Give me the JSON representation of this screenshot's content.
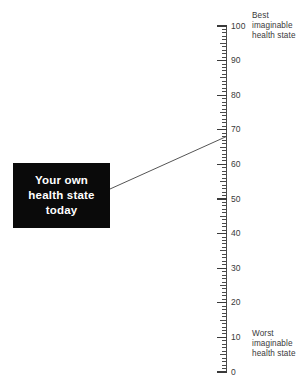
{
  "figure": {
    "name": "eq5d-visual-analogue-scale",
    "background_color": "#ffffff",
    "line_color": "#4a4a4a"
  },
  "callout": {
    "name": "your-own-health-state-today",
    "background_color": "#0a0a0a",
    "text_color": "#ffffff",
    "line1": "Your own",
    "line2": "health state",
    "line3": "today",
    "pointer_value": 68
  },
  "anchors": {
    "best": {
      "line1": "Best",
      "line2": "imaginable",
      "line3": "health state",
      "value": 100
    },
    "worst": {
      "line1": "Worst",
      "line2": "imaginable",
      "line3": "health state",
      "value": 0
    }
  },
  "chart_data": {
    "type": "scatter",
    "title": "",
    "xlabel": "",
    "ylabel": "",
    "ylim": [
      0,
      100
    ],
    "orientation": "vertical",
    "grid": false,
    "legend": "none",
    "tick_major_step": 10,
    "tick_minor_step": 1,
    "tick_mid_step": 5,
    "tick_labels": [
      "100",
      "90",
      "80",
      "70",
      "60",
      "50",
      "40",
      "30",
      "20",
      "10",
      "0"
    ],
    "tick_values": [
      100,
      90,
      80,
      70,
      60,
      50,
      40,
      30,
      20,
      10,
      0
    ],
    "annotations": [
      {
        "text": "Best imaginable health state",
        "value": 100
      },
      {
        "text": "Worst imaginable health state",
        "value": 0
      },
      {
        "text": "Your own health state today",
        "value": 68
      }
    ],
    "series": [
      {
        "name": "Your own health state today",
        "values": [
          68
        ]
      }
    ]
  }
}
